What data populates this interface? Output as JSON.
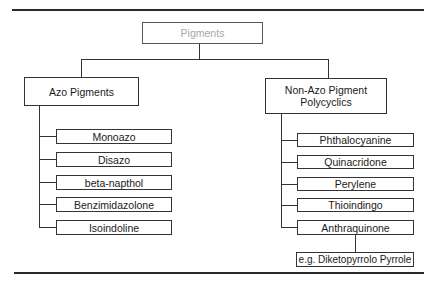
{
  "diagram": {
    "root": {
      "label": "Pigments"
    },
    "branches": [
      {
        "label": "Azo Pigments",
        "children": [
          {
            "label": "Monoazo"
          },
          {
            "label": "Disazo"
          },
          {
            "label": "beta-napthol"
          },
          {
            "label": "Benzimidazolone"
          },
          {
            "label": "Isoindoline"
          }
        ]
      },
      {
        "label": "Non-Azo Pigment Polycyclics",
        "children": [
          {
            "label": "Phthalocyanine"
          },
          {
            "label": "Quinacridone"
          },
          {
            "label": "Perylene"
          },
          {
            "label": "Thioindingo"
          },
          {
            "label": "Anthraquinone"
          }
        ],
        "example": {
          "label": "e.g. Diketopyrrolo Pyrrole"
        }
      }
    ]
  },
  "colors": {
    "root_text": "#a8a8a8",
    "lines": "#333333"
  }
}
